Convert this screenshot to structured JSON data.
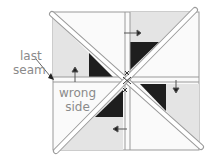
{
  "diagram": {
    "labels": {
      "last_seam_line1": "last",
      "last_seam_line2": "seam",
      "wrong_side_line1": "wrong",
      "wrong_side_line2": "side"
    },
    "colors": {
      "light_fabric": "#e4e4e4",
      "white_fabric": "#fafafa",
      "dark_fabric": "#1e1e1e",
      "outline": "#9a9a9a",
      "label_text": "#8a8a8a"
    }
  }
}
